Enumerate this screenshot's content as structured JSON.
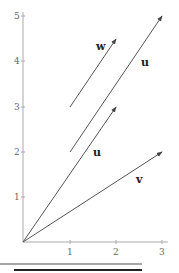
{
  "diagram": {
    "type": "vector-plot",
    "axes": {
      "x": {
        "min": 0,
        "max": 3,
        "ticks": [
          "1",
          "2",
          "3"
        ]
      },
      "y": {
        "min": 0,
        "max": 5,
        "ticks": [
          "1",
          "2",
          "3",
          "4",
          "5"
        ]
      }
    },
    "vectors": [
      {
        "label": "v",
        "from": [
          0,
          0
        ],
        "to": [
          3,
          2
        ]
      },
      {
        "label": "u",
        "from": [
          0,
          0
        ],
        "to": [
          2,
          3
        ]
      },
      {
        "label": "u",
        "from": [
          1,
          2
        ],
        "to": [
          3,
          5
        ]
      },
      {
        "label": "w",
        "from": [
          1,
          3
        ],
        "to": [
          2,
          4.5
        ]
      }
    ],
    "labels": {
      "v": "v",
      "u_lower": "u",
      "u_upper": "u",
      "w": "w"
    },
    "colors": {
      "vector": "#555555",
      "axis": "#aaaaaa",
      "rule_top": "#888888",
      "rule_bottom": "#222222"
    }
  }
}
